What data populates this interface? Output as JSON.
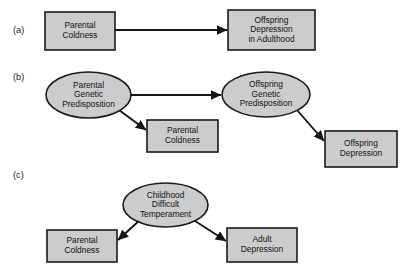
{
  "figure": {
    "background_color": "#ffffff",
    "shape_fill_color": "#cccccc",
    "shape_stroke_color": "#1a1a1a",
    "edge_color": "#151515"
  },
  "panels": [
    {
      "id": "panel-a",
      "label": "(a)",
      "label_x": 13,
      "label_y": 31,
      "nodes": [
        {
          "id": "a-parental-coldness",
          "name": "parental-coldness-box",
          "shape": "rect",
          "x": 45,
          "y": 12,
          "width": 70,
          "height": 38,
          "lines": [
            "Parental",
            "Coldness"
          ]
        },
        {
          "id": "a-offspring-depression",
          "name": "offspring-depression-adulthood-box",
          "shape": "rect",
          "x": 228,
          "y": 10,
          "width": 87,
          "height": 40,
          "lines": [
            "Offspring",
            "Depression",
            "in Adulthood"
          ]
        }
      ],
      "edges": [
        {
          "id": "a-edge-1",
          "name": "arrow-coldness-to-depression",
          "x1": 115,
          "y1": 30,
          "x2": 227,
          "y2": 30
        }
      ]
    },
    {
      "id": "panel-b",
      "label": "(b)",
      "label_x": 13,
      "label_y": 78,
      "nodes": [
        {
          "id": "b-parental-genetic",
          "name": "parental-genetic-predisposition-ellipse",
          "shape": "ellipse",
          "x": 46,
          "y": 72,
          "width": 85,
          "height": 46,
          "lines": [
            "Parental",
            "Genetic",
            "Predisposition"
          ]
        },
        {
          "id": "b-offspring-genetic",
          "name": "offspring-genetic-predisposition-ellipse",
          "shape": "ellipse",
          "x": 222,
          "y": 72,
          "width": 88,
          "height": 45,
          "lines": [
            "Offspring",
            "Genetic",
            "Predisposition"
          ]
        },
        {
          "id": "b-parental-coldness",
          "name": "parental-coldness-box",
          "shape": "rect",
          "x": 147,
          "y": 120,
          "width": 71,
          "height": 32,
          "lines": [
            "Parental",
            "Coldness"
          ]
        },
        {
          "id": "b-offspring-depression",
          "name": "offspring-depression-box",
          "shape": "rect",
          "x": 325,
          "y": 131,
          "width": 72,
          "height": 36,
          "lines": [
            "Offspring",
            "Depression"
          ]
        }
      ],
      "edges": [
        {
          "id": "b-edge-1",
          "name": "arrow-parental-genetic-to-offspring-genetic",
          "x1": 131,
          "y1": 95,
          "x2": 221,
          "y2": 95
        },
        {
          "id": "b-edge-2",
          "name": "arrow-parental-genetic-to-parental-coldness",
          "x1": 119,
          "y1": 110,
          "x2": 146,
          "y2": 130
        },
        {
          "id": "b-edge-3",
          "name": "arrow-offspring-genetic-to-offspring-depression",
          "x1": 297,
          "y1": 110,
          "x2": 324,
          "y2": 141
        }
      ]
    },
    {
      "id": "panel-c",
      "label": "(c)",
      "label_x": 13,
      "label_y": 176,
      "nodes": [
        {
          "id": "c-childhood-temperament",
          "name": "childhood-difficult-temperament-ellipse",
          "shape": "ellipse",
          "x": 123,
          "y": 183,
          "width": 85,
          "height": 44,
          "lines": [
            "Childhood",
            "Difficult",
            "Temperament"
          ]
        },
        {
          "id": "c-parental-coldness",
          "name": "parental-coldness-box",
          "shape": "rect",
          "x": 47,
          "y": 230,
          "width": 70,
          "height": 32,
          "lines": [
            "Parental",
            "Coldness"
          ]
        },
        {
          "id": "c-adult-depression",
          "name": "adult-depression-box",
          "shape": "rect",
          "x": 227,
          "y": 228,
          "width": 70,
          "height": 34,
          "lines": [
            "Adult",
            "Depression"
          ]
        }
      ],
      "edges": [
        {
          "id": "c-edge-1",
          "name": "arrow-temperament-to-parental-coldness",
          "x1": 141,
          "y1": 219,
          "x2": 118,
          "y2": 240
        },
        {
          "id": "c-edge-2",
          "name": "arrow-temperament-to-adult-depression",
          "x1": 192,
          "y1": 219,
          "x2": 226,
          "y2": 241
        }
      ]
    }
  ]
}
